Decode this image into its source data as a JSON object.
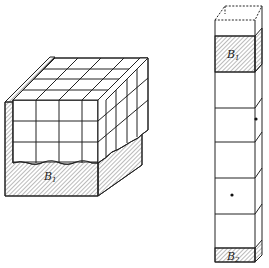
{
  "figure": {
    "type": "diagram",
    "colors": {
      "line": "#222222",
      "hatch": "#555555",
      "background": "#ffffff"
    }
  },
  "left_block": {
    "reservoir_label": "B",
    "reservoir_subscript": "1",
    "grid_columns": 4,
    "grid_rows": 3,
    "grid_depth": 4
  },
  "right_column": {
    "top_reservoir_label": "B",
    "top_reservoir_subscript": "1",
    "bottom_reservoir_label": "B",
    "bottom_reservoir_subscript": "2",
    "segments": 5,
    "dots": 2
  }
}
